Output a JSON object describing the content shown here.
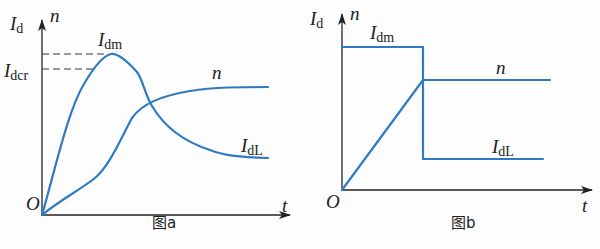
{
  "figures": [
    {
      "id": "a",
      "caption": "图a",
      "y_axis_label_main": "I",
      "y_axis_label_sub": "d",
      "y_axis_label_second": "n",
      "x_axis_label": "t",
      "origin_label": "O",
      "labels": {
        "idm_main": "I",
        "idm_sub": "dm",
        "idcr_main": "I",
        "idcr_sub": "dcr",
        "n": "n",
        "idl_main": "I",
        "idl_sub": "dL"
      }
    },
    {
      "id": "b",
      "caption": "图b",
      "y_axis_label_main": "I",
      "y_axis_label_sub": "d",
      "y_axis_label_second": "n",
      "x_axis_label": "t",
      "origin_label": "O",
      "labels": {
        "idm_main": "I",
        "idm_sub": "dm",
        "n": "n",
        "idl_main": "I",
        "idl_sub": "dL"
      }
    }
  ],
  "colors": {
    "curve": "#2f7ac4",
    "axis": "#222222"
  }
}
